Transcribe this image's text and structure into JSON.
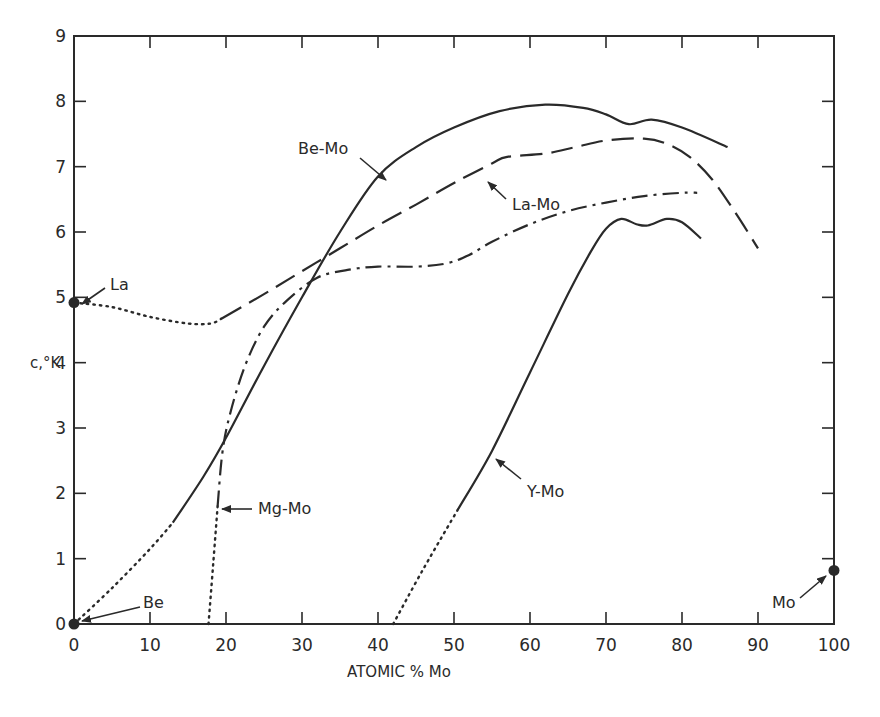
{
  "chart_data": {
    "type": "line",
    "title": "",
    "xlabel": "ATOMIC % Mo",
    "ylabel": "c,°K",
    "xlim": [
      0,
      100
    ],
    "ylim": [
      0,
      9
    ],
    "xticks": [
      0,
      10,
      20,
      30,
      40,
      50,
      60,
      70,
      80,
      90,
      100
    ],
    "yticks": [
      0,
      1,
      2,
      3,
      4,
      5,
      6,
      7,
      8,
      9
    ],
    "xtick_labels": [
      "0",
      "10",
      "20",
      "30",
      "40",
      "50",
      "60",
      "70",
      "80",
      "90",
      "100"
    ],
    "ytick_labels": [
      "0",
      "1",
      "2",
      "3",
      "4",
      "5",
      "6",
      "7",
      "8",
      "9"
    ],
    "grid": false,
    "legend": "none (curves labeled directly with arrows)",
    "series": [
      {
        "name": "Be-Mo",
        "style": "solid",
        "extrapolated_dotted": [
          [
            0,
            0
          ],
          [
            5,
            0.55
          ],
          [
            10,
            1.15
          ],
          [
            13,
            1.55
          ]
        ],
        "points": [
          [
            13,
            1.55
          ],
          [
            17,
            2.25
          ],
          [
            20,
            2.85
          ],
          [
            25,
            3.95
          ],
          [
            30,
            5.0
          ],
          [
            35,
            6.0
          ],
          [
            40,
            6.85
          ],
          [
            45,
            7.3
          ],
          [
            50,
            7.6
          ],
          [
            56,
            7.85
          ],
          [
            62,
            7.95
          ],
          [
            67,
            7.9
          ],
          [
            70,
            7.8
          ],
          [
            73,
            7.65
          ],
          [
            76,
            7.72
          ],
          [
            80,
            7.6
          ],
          [
            86,
            7.3
          ]
        ]
      },
      {
        "name": "La-Mo",
        "style": "dashed",
        "extrapolated_dotted": [
          [
            0,
            4.92
          ],
          [
            5,
            4.85
          ],
          [
            10,
            4.7
          ],
          [
            15,
            4.6
          ],
          [
            18,
            4.6
          ],
          [
            19.5,
            4.68
          ]
        ],
        "points": [
          [
            19.5,
            4.68
          ],
          [
            25,
            5.05
          ],
          [
            30,
            5.4
          ],
          [
            35,
            5.75
          ],
          [
            40,
            6.1
          ],
          [
            45,
            6.42
          ],
          [
            50,
            6.75
          ],
          [
            55,
            7.05
          ],
          [
            57,
            7.15
          ],
          [
            62,
            7.2
          ],
          [
            66,
            7.3
          ],
          [
            70,
            7.4
          ],
          [
            75,
            7.43
          ],
          [
            78,
            7.35
          ],
          [
            81,
            7.15
          ],
          [
            84,
            6.8
          ],
          [
            87,
            6.3
          ],
          [
            90,
            5.75
          ]
        ]
      },
      {
        "name": "Mg-Mo",
        "style": "dash-dot",
        "extrapolated_dotted": [
          [
            17.7,
            0
          ],
          [
            18.3,
            0.9
          ],
          [
            18.9,
            1.8
          ]
        ],
        "points": [
          [
            18.9,
            1.8
          ],
          [
            19.5,
            2.6
          ],
          [
            20.5,
            3.2
          ],
          [
            22.5,
            3.95
          ],
          [
            25,
            4.55
          ],
          [
            28,
            4.95
          ],
          [
            32,
            5.3
          ],
          [
            36,
            5.42
          ],
          [
            40,
            5.47
          ],
          [
            45,
            5.47
          ],
          [
            49,
            5.52
          ],
          [
            52,
            5.65
          ],
          [
            55,
            5.85
          ],
          [
            60,
            6.12
          ],
          [
            65,
            6.32
          ],
          [
            70,
            6.45
          ],
          [
            75,
            6.55
          ],
          [
            80,
            6.6
          ],
          [
            82,
            6.6
          ]
        ]
      },
      {
        "name": "Y-Mo",
        "style": "solid",
        "extrapolated_dotted": [
          [
            42,
            0
          ],
          [
            46,
            0.85
          ],
          [
            50.5,
            1.75
          ]
        ],
        "points": [
          [
            50.5,
            1.75
          ],
          [
            55,
            2.65
          ],
          [
            60,
            3.85
          ],
          [
            65,
            5.05
          ],
          [
            68,
            5.7
          ],
          [
            70,
            6.05
          ],
          [
            72,
            6.2
          ],
          [
            74,
            6.12
          ],
          [
            75.5,
            6.1
          ],
          [
            78,
            6.2
          ],
          [
            80,
            6.15
          ],
          [
            82.5,
            5.9
          ]
        ]
      }
    ],
    "element_points": [
      {
        "name": "La",
        "x": 0,
        "y": 4.92
      },
      {
        "name": "Be",
        "x": 0,
        "y": 0
      },
      {
        "name": "Mo",
        "x": 100,
        "y": 0.82
      }
    ],
    "annotations": [
      {
        "text": "Be-Mo",
        "arrow_to": [
          40,
          6.85
        ]
      },
      {
        "text": "La-Mo",
        "arrow_to": [
          55,
          7.05
        ]
      },
      {
        "text": "Mg-Mo",
        "arrow_to": [
          19.1,
          1.95
        ]
      },
      {
        "text": "Y-Mo",
        "arrow_to": [
          57,
          2.55
        ]
      },
      {
        "text": "La",
        "arrow_to": [
          0,
          4.92
        ]
      },
      {
        "text": "Be",
        "arrow_to": [
          0,
          0
        ]
      },
      {
        "text": "Mo",
        "arrow_to": [
          100,
          0.82
        ]
      }
    ]
  },
  "labels": {
    "xlabel": "ATOMIC % Mo",
    "ylabel": "c,°K",
    "be_mo": "Be-Mo",
    "la_mo": "La-Mo",
    "mg_mo": "Mg-Mo",
    "y_mo": "Y-Mo",
    "la": "La",
    "be": "Be",
    "mo": "Mo"
  }
}
